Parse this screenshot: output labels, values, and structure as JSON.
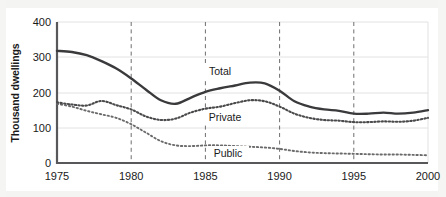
{
  "chart_data": {
    "type": "line",
    "title": "",
    "subtitle": "",
    "xlabel": "",
    "ylabel": "Thousand dwellings",
    "xlim": [
      1975,
      2000
    ],
    "ylim": [
      0,
      400
    ],
    "yticks": [
      0,
      100,
      200,
      300,
      400
    ],
    "ytick_labels": [
      "0",
      "100",
      "200",
      "300",
      "400"
    ],
    "xticks": [
      1975,
      1980,
      1985,
      1990,
      1995,
      2000
    ],
    "xtick_labels": [
      "1975",
      "1980",
      "1985",
      "1990",
      "1995",
      "2000"
    ],
    "grid": {
      "horizontal": true,
      "vertical_dashed_at": [
        1980,
        1985,
        1990,
        1995
      ]
    },
    "legend": {
      "position": "inline-annotations"
    },
    "x": [
      1975,
      1976,
      1977,
      1978,
      1979,
      1980,
      1981,
      1982,
      1983,
      1984,
      1985,
      1986,
      1987,
      1988,
      1989,
      1990,
      1991,
      1992,
      1993,
      1994,
      1995,
      1996,
      1997,
      1998,
      1999,
      2000
    ],
    "series": [
      {
        "name": "Total",
        "style": "solid",
        "color": "#3a3a3c",
        "values": [
          318,
          315,
          306,
          289,
          268,
          240,
          208,
          178,
          168,
          185,
          202,
          212,
          220,
          228,
          226,
          205,
          175,
          160,
          152,
          148,
          140,
          140,
          143,
          140,
          143,
          150
        ]
      },
      {
        "name": "Private",
        "style": "dotted",
        "color": "#4a4a4c",
        "values": [
          172,
          166,
          163,
          176,
          164,
          152,
          132,
          122,
          126,
          143,
          154,
          160,
          170,
          178,
          175,
          160,
          140,
          128,
          122,
          120,
          116,
          116,
          118,
          117,
          120,
          128
        ]
      },
      {
        "name": "Public",
        "style": "dotted",
        "color": "#6a6a6c",
        "values": [
          168,
          160,
          148,
          138,
          128,
          110,
          86,
          62,
          50,
          48,
          50,
          50,
          48,
          46,
          44,
          40,
          34,
          30,
          28,
          27,
          26,
          25,
          24,
          24,
          23,
          22
        ]
      }
    ],
    "annotations": [
      {
        "text": "Total",
        "x": 1987,
        "y": 268
      },
      {
        "text": "Private",
        "x": 1988,
        "y": 140
      },
      {
        "text": "Public",
        "x": 1988,
        "y": 44
      }
    ]
  },
  "axes": {
    "y_axis_label": "Thousand dwellings",
    "y_tick_0": "0",
    "y_tick_100": "100",
    "y_tick_200": "200",
    "y_tick_300": "300",
    "y_tick_400": "400",
    "x_tick_1975": "1975",
    "x_tick_1980": "1980",
    "x_tick_1985": "1985",
    "x_tick_1990": "1990",
    "x_tick_1995": "1995",
    "x_tick_2000": "2000"
  },
  "labels": {
    "total": "Total",
    "private": "Private",
    "public": "Public"
  },
  "colors": {
    "total": "#3a3a3c",
    "private": "#4a4a4c",
    "public": "#6a6a6c",
    "axis": "#58585a",
    "grid": "#e2e2e2",
    "background": "#ffffff"
  }
}
